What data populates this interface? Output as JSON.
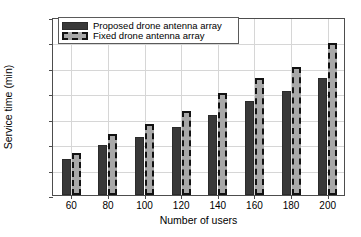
{
  "chart_data": {
    "type": "bar",
    "title": "",
    "xlabel": "Number of users",
    "ylabel": "Service time (min)",
    "categories": [
      "60",
      "80",
      "100",
      "120",
      "140",
      "160",
      "180",
      "200"
    ],
    "series": [
      {
        "name": "Proposed drone antenna array",
        "color": "#383838",
        "values": [
          7,
          9.8,
          11.4,
          13.4,
          15.7,
          18.5,
          20.5,
          23
        ]
      },
      {
        "name": "Fixed drone antenna array",
        "color": "#a8a8a8",
        "values": [
          8.2,
          12,
          14,
          16.5,
          20,
          23,
          25.2,
          29.8
        ]
      }
    ],
    "ylim": [
      0,
      35
    ],
    "yticks": [
      0,
      5,
      10,
      15,
      20,
      25,
      30,
      35
    ],
    "ytick_labels": [
      "0",
      "5",
      "10",
      "15",
      "20",
      "25",
      "30",
      "35"
    ],
    "grid": "both",
    "legend_position": "upper left"
  },
  "legend": {
    "entries": [
      {
        "label": "Proposed drone antenna array",
        "swatch": "proposed-bar-swatch"
      },
      {
        "label": "Fixed drone antenna array",
        "swatch": "fixed-bar-swatch"
      }
    ]
  }
}
